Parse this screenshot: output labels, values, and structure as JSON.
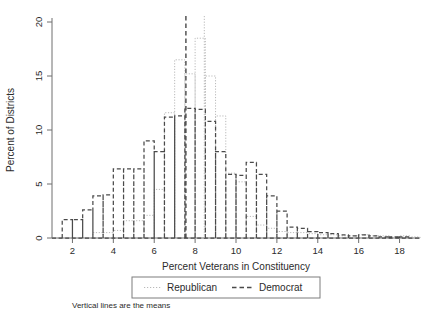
{
  "chart_data": {
    "type": "bar",
    "title": "",
    "subtitle": "",
    "xlabel": "Percent Veterans in Constituency",
    "ylabel": "Percent of Districts",
    "xlim": [
      1.0,
      19.0
    ],
    "ylim": [
      0,
      20
    ],
    "xticks": [
      2,
      4,
      6,
      8,
      10,
      12,
      14,
      16,
      18
    ],
    "yticks": [
      0,
      5,
      10,
      15,
      20
    ],
    "grid": false,
    "legend_position": "below-axis",
    "bin_width": 0.5,
    "bin_starts": [
      1.0,
      1.5,
      2.0,
      2.5,
      3.0,
      3.5,
      4.0,
      4.5,
      5.0,
      5.5,
      6.0,
      6.5,
      7.0,
      7.5,
      8.0,
      8.5,
      9.0,
      9.5,
      10.0,
      10.5,
      11.0,
      11.5,
      12.0,
      12.5,
      13.0,
      13.5,
      14.0,
      14.5,
      15.0,
      15.5,
      16.0,
      16.5,
      17.0,
      17.5,
      18.0,
      18.5
    ],
    "series": [
      {
        "name": "Republican",
        "style": "dotted",
        "color": "#b9b9b9",
        "mean": 8.45,
        "values": [
          0,
          0,
          0,
          0,
          0.5,
          0.5,
          0.7,
          1.6,
          1.6,
          2.1,
          4.5,
          11.6,
          16.5,
          15.2,
          18.5,
          15.0,
          11.3,
          6.0,
          5.2,
          2.0,
          1.2,
          0.9,
          0.6,
          0.5,
          0.5,
          0.4,
          0.3,
          0.3,
          0.2,
          0.2,
          0.3,
          0.2,
          0.2,
          0.1,
          0.2,
          0.1
        ]
      },
      {
        "name": "Democrat",
        "style": "dashed",
        "color": "#4a4a4a",
        "mean": 7.55,
        "values": [
          0,
          1.7,
          1.7,
          2.6,
          3.9,
          4.0,
          6.4,
          6.4,
          6.4,
          9.0,
          8.0,
          11.2,
          11.3,
          12.0,
          11.9,
          10.8,
          8.0,
          5.9,
          5.8,
          7.0,
          5.9,
          3.9,
          2.5,
          1.0,
          0.9,
          0.6,
          0.5,
          0.4,
          0.3,
          0.2,
          0.3,
          0.2,
          0.1,
          0.1,
          0.1,
          0.0
        ]
      }
    ],
    "legend_entries": [
      {
        "label": "Republican",
        "style": "dotted"
      },
      {
        "label": "Democrat",
        "style": "dashed"
      }
    ],
    "footnote": "Vertical lines are the means",
    "mean_lines": [
      {
        "series": "Democrat",
        "value": 7.55,
        "style": "dashed"
      },
      {
        "series": "Republican",
        "value": 8.45,
        "style": "dotted"
      }
    ]
  }
}
